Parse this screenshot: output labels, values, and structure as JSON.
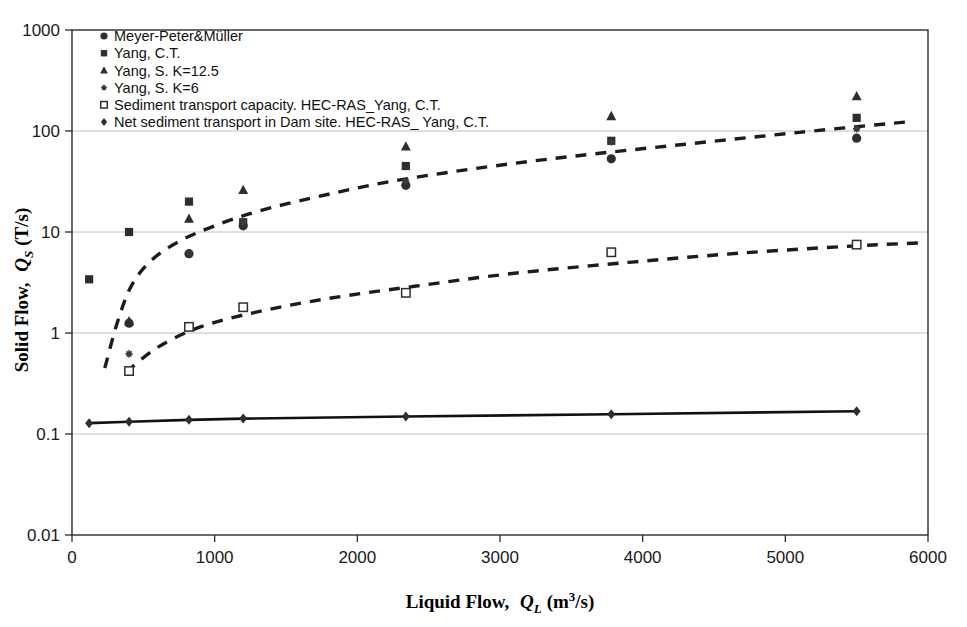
{
  "chart_data": {
    "type": "scatter",
    "title": "",
    "xlabel": "Liquid Flow, Q_L (m3/s)",
    "ylabel": "Solid Flow, Q_S (T/s)",
    "xlabel_main": "Liquid Flow,",
    "xlabel_symbol": "Q",
    "xlabel_symbol_sub": "L",
    "xlabel_units_pre": "(m",
    "xlabel_units_sup": "3",
    "xlabel_units_post": "/s)",
    "ylabel_main": "Solid Flow,",
    "ylabel_symbol": "Q",
    "ylabel_symbol_sub": "S",
    "ylabel_units": "(T/s)",
    "xlim": [
      0,
      6000
    ],
    "ylim": [
      0.01,
      1000
    ],
    "yscale": "log",
    "xscale": "linear",
    "grid": "horizontal",
    "legend_position": "top-left",
    "xticks": [
      "0",
      "1000",
      "2000",
      "3000",
      "4000",
      "5000",
      "6000"
    ],
    "xtick_values": [
      0,
      1000,
      2000,
      3000,
      4000,
      5000,
      6000
    ],
    "yticks": [
      "0.01",
      "0.1",
      "1",
      "10",
      "100",
      "1000"
    ],
    "ytick_values": [
      0.01,
      0.1,
      1,
      10,
      100,
      1000
    ],
    "series": [
      {
        "name": "Meyer-Peter&Müller",
        "marker": "filled-circle",
        "color": "#2e2e2e",
        "x": [
          400,
          820,
          1200,
          2340,
          3780,
          5500
        ],
        "y": [
          1.25,
          6.1,
          11.5,
          29.0,
          53.0,
          85.0
        ]
      },
      {
        "name": "Yang, C.T.",
        "marker": "filled-square",
        "color": "#2e2e2e",
        "x": [
          120,
          400,
          820,
          1200,
          2340,
          3780,
          5500
        ],
        "y": [
          3.4,
          10.0,
          20.0,
          12.5,
          45.0,
          80.0,
          135.0
        ]
      },
      {
        "name": "Yang, S. K=12.5",
        "marker": "filled-triangle",
        "color": "#555555",
        "x": [
          400,
          820,
          1200,
          2340,
          3780,
          5500
        ],
        "y": [
          1.3,
          13.5,
          26.0,
          70.0,
          140.0,
          220.0
        ]
      },
      {
        "name": "Yang, S. K=6",
        "marker": "plus",
        "color": "#3a3a3a",
        "x": [
          400,
          820,
          1200,
          2340,
          3780,
          5500
        ],
        "y": [
          0.62,
          6.2,
          12.5,
          32.0,
          78.0,
          105.0
        ]
      },
      {
        "name": "Sediment transport capacity. HEC-RAS_Yang, C.T.",
        "marker": "open-square",
        "color": "#2e2e2e",
        "x": [
          400,
          820,
          1200,
          2340,
          3780,
          5500
        ],
        "y": [
          0.42,
          1.15,
          1.8,
          2.5,
          6.3,
          7.5
        ]
      },
      {
        "name": "Net sediment transport in Dam site. HEC-RAS_ Yang, C.T.",
        "marker": "filled-diamond",
        "color": "#111111",
        "line": "solid",
        "x": [
          120,
          400,
          820,
          1200,
          2340,
          3780,
          5500
        ],
        "y": [
          0.128,
          0.132,
          0.138,
          0.142,
          0.149,
          0.157,
          0.168
        ]
      }
    ],
    "trendlines": [
      {
        "name": "upper-dashed-trend",
        "style": "dashed",
        "x": [
          230,
          320,
          420,
          560,
          760,
          1000,
          1300,
          1700,
          2200,
          2800,
          3500,
          4300,
          5100,
          5900
        ],
        "y": [
          0.45,
          1.3,
          3.0,
          5.3,
          8.2,
          11.5,
          16.0,
          22.0,
          31.0,
          42.0,
          56.0,
          74.0,
          97.0,
          125.0
        ]
      },
      {
        "name": "lower-dashed-trend",
        "style": "dashed",
        "x": [
          380,
          600,
          900,
          1300,
          1800,
          2400,
          3100,
          3900,
          4700,
          5500,
          5950
        ],
        "y": [
          0.41,
          0.72,
          1.15,
          1.62,
          2.2,
          2.9,
          3.9,
          5.0,
          6.2,
          7.3,
          7.8
        ]
      }
    ],
    "legend": [
      {
        "label": "Meyer-Peter&Müller",
        "marker": "filled-circle"
      },
      {
        "label": "Yang, C.T.",
        "marker": "filled-square"
      },
      {
        "label": "Yang, S. K=12.5",
        "marker": "filled-triangle"
      },
      {
        "label": "Yang, S. K=6",
        "marker": "plus"
      },
      {
        "label": "Sediment transport capacity. HEC-RAS_Yang, C.T.",
        "marker": "open-square"
      },
      {
        "label": "Net sediment transport in Dam site. HEC-RAS_ Yang, C.T.",
        "marker": "filled-diamond"
      }
    ],
    "colors": {
      "axis": "#2b2b2b",
      "grid": "#b9b9b9",
      "marker": "#2e2e2e",
      "background": "#ffffff"
    }
  }
}
